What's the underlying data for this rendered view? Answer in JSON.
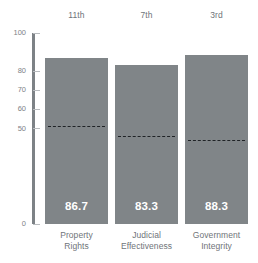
{
  "chart_data": {
    "type": "bar",
    "title": "",
    "subtitle": "",
    "xlabel": "",
    "ylabel": "",
    "ylim": [
      0,
      100
    ],
    "grid": false,
    "legend": "none",
    "categories": [
      "Property Rights",
      "Judicial Effectiveness",
      "Government Integrity"
    ],
    "category_lines": [
      [
        "Property",
        "Rights"
      ],
      [
        "Judicial",
        "Effectiveness"
      ],
      [
        "Government",
        "Integrity"
      ]
    ],
    "values": [
      86.7,
      83.3,
      88.3
    ],
    "value_labels": [
      "86.7",
      "83.3",
      "88.3"
    ],
    "ranks": [
      "11th",
      "7th",
      "3rd"
    ],
    "reference_lines": [
      51.5,
      46.0,
      44.0
    ],
    "ytick_values": [
      100,
      80,
      70,
      60,
      50,
      0
    ],
    "ytick_labels": [
      "100",
      "80",
      "70",
      "60",
      "50",
      "0"
    ],
    "colors": {
      "bar": "#808588",
      "axis": "#7d8286",
      "tick_text": "#7d8286",
      "label_text": "#6f7479",
      "value_text": "#ffffff",
      "reference_line": "#1f2326",
      "background": "#ffffff"
    }
  }
}
